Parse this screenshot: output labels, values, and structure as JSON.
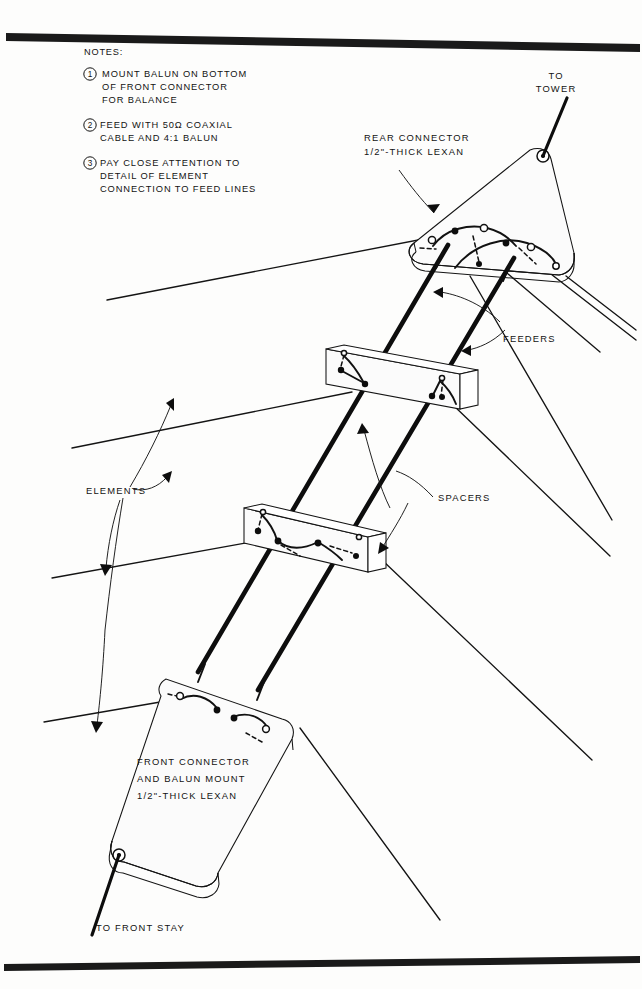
{
  "document": {
    "type": "technical-illustration",
    "subject": "Log periodic wire antenna connector and feeder assembly",
    "background_color": "#fdfdfc",
    "ink_color": "#121212"
  },
  "notes": {
    "heading": "NOTES:",
    "items": [
      {
        "number": "1",
        "lines": [
          "MOUNT BALUN ON BOTTOM",
          "OF FRONT CONNECTOR",
          "FOR BALANCE"
        ]
      },
      {
        "number": "2",
        "lines": [
          "FEED WITH 50Ω COAXIAL",
          "CABLE AND 4:1 BALUN"
        ]
      },
      {
        "number": "3",
        "lines": [
          "PAY CLOSE ATTENTION TO",
          "DETAIL OF ELEMENT",
          "CONNECTION TO FEED LINES"
        ]
      }
    ]
  },
  "callouts": {
    "to_tower": {
      "lines": [
        "TO",
        "TOWER"
      ]
    },
    "rear_connector": {
      "lines": [
        "REAR   CONNECTOR",
        "1/2\"-THICK  LEXAN"
      ]
    },
    "feeders": {
      "label": "FEEDERS"
    },
    "spacers": {
      "label": "SPACERS"
    },
    "elements": {
      "label": "ELEMENTS"
    },
    "front_connector": {
      "lines": [
        "FRONT CONNECTOR",
        "AND BALUN MOUNT",
        "1/2\"-THICK LEXAN"
      ]
    },
    "to_front_stay": {
      "label": "TO FRONT STAY"
    }
  },
  "parts": {
    "rear_connector_plate": "rounded triangular lexan plate",
    "front_connector_plate": "elongated rounded lexan plate",
    "spacer_count": 2,
    "feeder_count": 2
  },
  "frame": {
    "top_rule": true,
    "bottom_rule": true
  }
}
